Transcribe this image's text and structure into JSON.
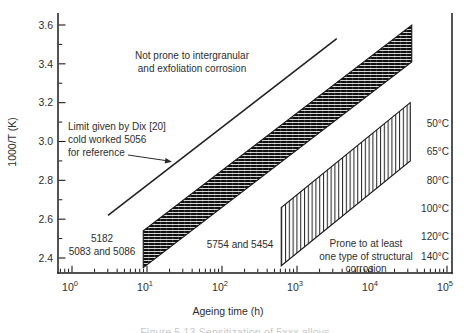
{
  "figure": {
    "background": "#ffffff",
    "ink": "#1a1a1a"
  },
  "chart_data": {
    "type": "area",
    "title": "",
    "xlabel": "Ageing time (h)",
    "ylabel": "1000/T (K)",
    "x_scale": "log10",
    "grid": false,
    "xlim_exp": [
      -0.19,
      5.07
    ],
    "ylim": [
      2.33,
      3.66
    ],
    "x_tick_exponents": [
      0,
      1,
      2,
      3,
      4,
      5
    ],
    "x_tick_labels": [
      "10⁰",
      "10¹",
      "10²",
      "10³",
      "10⁴",
      "10⁵"
    ],
    "y_ticks": [
      3.6,
      3.4,
      3.2,
      3.0,
      2.8,
      2.6,
      2.4
    ],
    "y_minor_ticks": [
      3.5,
      3.3,
      3.1,
      2.9,
      2.7,
      2.5
    ],
    "series": [
      {
        "name": "dix-limit-line",
        "type": "line",
        "label": "Limit given by Dix [20] cold worked 5056 for reference",
        "points_exp": [
          [
            0.48,
            2.62
          ],
          [
            3.53,
            3.53
          ]
        ]
      },
      {
        "name": "band-5182-5083-5086-5754-5454",
        "type": "band",
        "hatch": "horizontal-dense",
        "label": "5182, 5083 and 5086 / 5754 and 5454 sensitization band",
        "polygon_exp": [
          [
            0.95,
            2.54
          ],
          [
            0.95,
            2.35
          ],
          [
            4.53,
            3.41
          ],
          [
            4.53,
            3.6
          ]
        ]
      },
      {
        "name": "band-prone-to-corrosion",
        "type": "band",
        "hatch": "vertical",
        "label": "Prone to at least one type of structural corrosion",
        "polygon_exp": [
          [
            2.79,
            2.66
          ],
          [
            2.79,
            2.36
          ],
          [
            4.51,
            2.9
          ],
          [
            4.51,
            3.2
          ]
        ]
      }
    ]
  },
  "annotations": {
    "not_prone": [
      "Not prone to intergranular",
      "and exfoliation corrosion"
    ],
    "dix_limit": [
      "Limit given by Dix [20]",
      "cold worked 5056",
      "for reference"
    ],
    "alloys_left": [
      "5182",
      "5083 and 5086"
    ],
    "alloys_mid": "5754 and 5454",
    "prone": [
      "Prone to at least",
      "one type of structural",
      "corrosion"
    ]
  },
  "right_labels": [
    "50°C",
    "65°C",
    "80°C",
    "100°C",
    "120°C",
    "140°C"
  ],
  "caption_fragment": "Figure 5.13 Sensitization of 5xxx alloys"
}
